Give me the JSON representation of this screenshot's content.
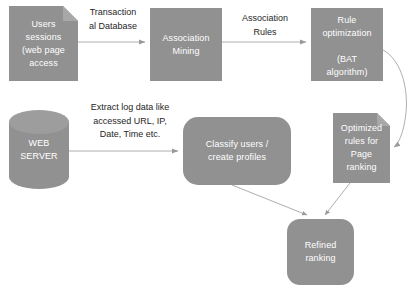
{
  "diagram": {
    "fill_color": "#919191",
    "edge_color": "#aeaeae",
    "label_color": "#262626",
    "node_text_color": "#ffffff",
    "nodes": [
      {
        "id": "users-sessions",
        "shape": "document",
        "label": "Users\nsessions\n(web page\naccess"
      },
      {
        "id": "association-mining",
        "shape": "rectangle",
        "label": "Association\nMining"
      },
      {
        "id": "rule-optimization",
        "shape": "rectangle",
        "label": "Rule\noptimization\n\n(BAT\nalgorithm)"
      },
      {
        "id": "web-server",
        "shape": "cylinder",
        "label": "WEB\nSERVER"
      },
      {
        "id": "classify-users",
        "shape": "rounded-rectangle",
        "label": "Classify users /\ncreate profiles"
      },
      {
        "id": "optimized-rules",
        "shape": "document",
        "label": "Optimized\nrules for\nPage\nranking"
      },
      {
        "id": "refined-ranking",
        "shape": "rounded-rectangle",
        "label": "Refined\nranking"
      }
    ],
    "edge_labels": [
      {
        "id": "transactional-database",
        "text": "Transaction\nal Database"
      },
      {
        "id": "association-rules",
        "text": "Association\nRules"
      },
      {
        "id": "extract-log-data",
        "text": "Extract log data like\naccessed URL, IP,\nDate, Time etc."
      }
    ]
  }
}
